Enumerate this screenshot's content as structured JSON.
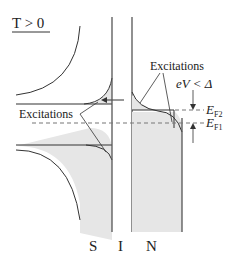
{
  "diagram": {
    "title": "T > 0",
    "regions": {
      "s": "S",
      "i": "I",
      "n": "N"
    },
    "labels": {
      "excitations_top": "Excitations",
      "excitations_left": "Excitations",
      "bias_condition": "eV < Δ",
      "ef2_main": "E",
      "ef2_sub": "F2",
      "ef1_main": "E",
      "ef1_sub": "F1"
    },
    "colors": {
      "line": "#333333",
      "fill": "#e6e6e6",
      "dash": "#777777"
    }
  }
}
